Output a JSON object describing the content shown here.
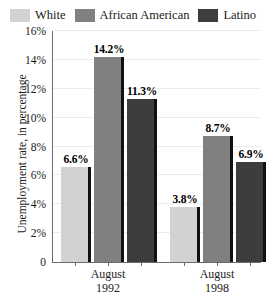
{
  "chart_data": {
    "type": "bar",
    "title": "",
    "subtitle": "",
    "xlabel": "",
    "ylabel": "Unemployment rate, in percentage",
    "categories": [
      "August 1992",
      "August 1998"
    ],
    "category_lines": [
      [
        "August",
        "1992"
      ],
      [
        "August",
        "1998"
      ]
    ],
    "series": [
      {
        "name": "White",
        "values": [
          6.6,
          3.8
        ],
        "labels": [
          "6.6%",
          "3.8%"
        ],
        "color": "#d2d2d2"
      },
      {
        "name": "African American",
        "values": [
          14.2,
          8.7
        ],
        "labels": [
          "14.2%",
          "8.7%"
        ],
        "color": "#808080"
      },
      {
        "name": "Latino",
        "values": [
          11.3,
          6.9
        ],
        "labels": [
          "11.3%",
          "6.9%"
        ],
        "color": "#3d3d3d"
      }
    ],
    "ylim": [
      0,
      16
    ],
    "ytick_values": [
      16,
      14,
      12,
      10,
      8,
      6,
      4,
      2,
      0
    ],
    "ytick_labels": [
      "16%",
      "14%",
      "12%",
      "10%",
      "8%",
      "6%",
      "4%",
      "2%",
      "0"
    ],
    "grid": true,
    "legend_position": "top"
  },
  "legend": {
    "items": [
      {
        "label": "White",
        "color": "#d2d2d2"
      },
      {
        "label": "African American",
        "color": "#808080"
      },
      {
        "label": "Latino",
        "color": "#3d3d3d"
      }
    ]
  },
  "axes": {
    "y_title": "Unemployment rate, in percentage"
  }
}
